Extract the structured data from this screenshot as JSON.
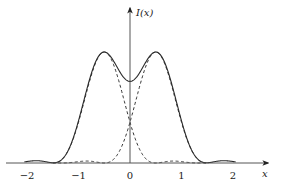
{
  "chart_data": {
    "type": "line",
    "title": "",
    "xlabel": "x",
    "ylabel": "I(x)",
    "xlim": [
      -2.05,
      2.05
    ],
    "ylim": [
      0,
      1.0
    ],
    "grid": false,
    "legend": null,
    "x_ticks": [
      -2,
      -1,
      0,
      1,
      2
    ],
    "x_tick_labels": [
      "−2",
      "−1",
      "0",
      "1",
      "2"
    ],
    "annotations": [],
    "model": {
      "description": "Two Airy-type diffraction patterns centered at x = -0.5 and x = +0.5 (Rayleigh criterion: first zero of each at the other's peak), and their sum",
      "centers": [
        -0.5,
        0.5
      ],
      "first_zero_distance": 1.0
    },
    "series": [
      {
        "name": "I1 (source at -0.5)",
        "style": "dashed",
        "x": [
          -2.0,
          -1.75,
          -1.5,
          -1.25,
          -1.0,
          -0.75,
          -0.5,
          -0.25,
          0.0,
          0.25,
          0.5,
          0.75,
          1.0,
          1.25,
          1.5
        ],
        "values": [
          0.004,
          0.0,
          0.017,
          0.0,
          0.07,
          0.56,
          1.0,
          0.56,
          0.32,
          0.07,
          0.0,
          0.017,
          0.01,
          0.0,
          0.004
        ]
      },
      {
        "name": "I2 (source at +0.5)",
        "style": "dashed",
        "x": [
          -1.5,
          -1.25,
          -1.0,
          -0.75,
          -0.5,
          -0.25,
          0.0,
          0.25,
          0.5,
          0.75,
          1.0,
          1.25,
          1.5,
          1.75,
          2.0
        ],
        "values": [
          0.004,
          0.0,
          0.01,
          0.017,
          0.0,
          0.07,
          0.32,
          0.56,
          1.0,
          0.56,
          0.07,
          0.0,
          0.017,
          0.0,
          0.004
        ]
      },
      {
        "name": "I(x) total",
        "style": "solid",
        "x": [
          -2.0,
          -1.85,
          -1.5,
          -1.25,
          -1.0,
          -0.75,
          -0.5,
          -0.25,
          0.0,
          0.25,
          0.5,
          0.75,
          1.0,
          1.25,
          1.5,
          1.85,
          2.0
        ],
        "values": [
          0.1,
          0.11,
          0.0,
          0.3,
          0.6,
          0.9,
          1.0,
          0.85,
          0.78,
          0.85,
          1.0,
          0.9,
          0.6,
          0.3,
          0.0,
          0.11,
          0.1
        ]
      }
    ]
  },
  "colors": {
    "axis": "#555555",
    "curve": "#2a2a2a",
    "dashed": "#333333",
    "background": "#ffffff"
  },
  "layout": {
    "origin_px": [
      130,
      163
    ],
    "px_per_unit_x": 51.5,
    "px_per_unit_y": 111,
    "x_axis_start_px": 6,
    "x_axis_end_px": 268,
    "y_axis_top_px": 8,
    "plot_x_range": [
      -2.05,
      2.05
    ]
  }
}
